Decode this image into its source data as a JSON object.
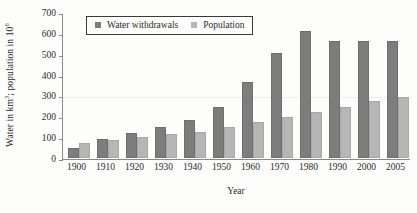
{
  "chart_data": {
    "type": "bar",
    "title": "",
    "xlabel": "Year",
    "ylabel": "Water in km3; population in 106",
    "ylabel_parts": {
      "pre_sup1": "Water in km",
      "sup1": "3",
      "mid": "; population in 10",
      "sup2": "6"
    },
    "categories": [
      "1900",
      "1910",
      "1920",
      "1930",
      "1940",
      "1950",
      "1960",
      "1970",
      "1980",
      "1990",
      "2000",
      "2005"
    ],
    "series": [
      {
        "name": "Water withdrawals",
        "color": "#7d7d7d",
        "values": [
          50,
          90,
          120,
          147,
          182,
          243,
          365,
          505,
          610,
          560,
          560,
          560
        ]
      },
      {
        "name": "Population",
        "color": "#b6b6b6",
        "values": [
          72,
          86,
          100,
          115,
          125,
          147,
          175,
          197,
          220,
          243,
          273,
          292
        ]
      }
    ],
    "ylim": [
      0,
      700
    ],
    "yticks": [
      0,
      100,
      200,
      300,
      400,
      500,
      600,
      700
    ],
    "ytick_labels": [
      "0",
      "100",
      "200",
      "300",
      "400",
      "500",
      "600",
      "700"
    ],
    "grid": false,
    "legend_position": "top-left-inside",
    "legend_entries": [
      "Water withdrawals",
      "Population"
    ]
  }
}
